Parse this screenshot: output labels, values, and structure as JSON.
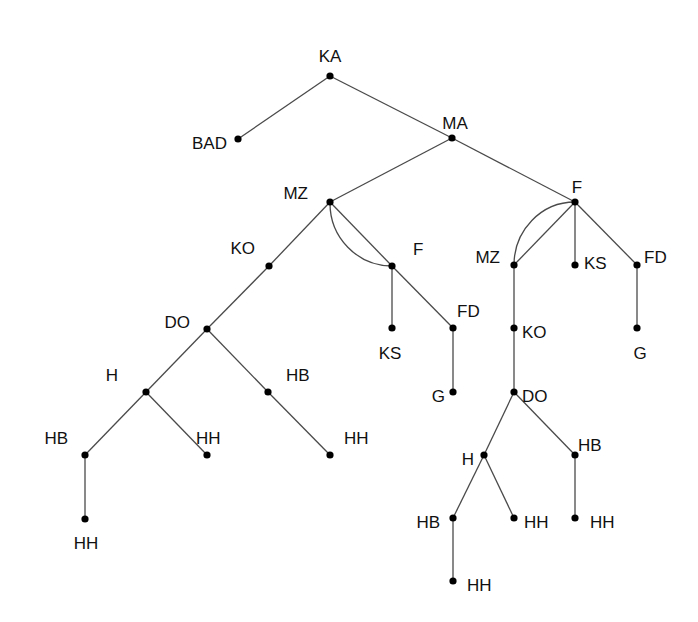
{
  "diagram": {
    "type": "tree",
    "colors": {
      "edge": "#4a4a4a",
      "node": "#000000",
      "label": "#111111",
      "background": "#ffffff"
    },
    "nodes": [
      {
        "id": "n1",
        "label": "KA",
        "x": 330,
        "y": 76,
        "lx": 330,
        "ly": 58,
        "anchor": "middle"
      },
      {
        "id": "n2",
        "label": "BAD",
        "x": 238,
        "y": 139,
        "lx": 227,
        "ly": 145,
        "anchor": "end"
      },
      {
        "id": "n3",
        "label": "MA",
        "x": 452,
        "y": 138,
        "lx": 455,
        "ly": 125,
        "anchor": "middle"
      },
      {
        "id": "n4",
        "label": "MZ",
        "x": 330,
        "y": 202,
        "lx": 308,
        "ly": 195,
        "anchor": "end"
      },
      {
        "id": "n5",
        "label": "F",
        "x": 575,
        "y": 202,
        "lx": 577,
        "ly": 189,
        "anchor": "middle"
      },
      {
        "id": "n6",
        "label": "KO",
        "x": 269,
        "y": 266,
        "lx": 255,
        "ly": 250,
        "anchor": "end"
      },
      {
        "id": "n7",
        "label": "F",
        "x": 392,
        "y": 266,
        "lx": 413,
        "ly": 251,
        "anchor": "start"
      },
      {
        "id": "n8",
        "label": "MZ",
        "x": 514,
        "y": 265,
        "lx": 500,
        "ly": 259,
        "anchor": "end"
      },
      {
        "id": "n9",
        "label": "KS",
        "x": 575,
        "y": 265,
        "lx": 584,
        "ly": 265,
        "anchor": "start"
      },
      {
        "id": "n10",
        "label": "FD",
        "x": 637,
        "y": 265,
        "lx": 644,
        "ly": 259,
        "anchor": "start"
      },
      {
        "id": "n11",
        "label": "DO",
        "x": 207,
        "y": 329,
        "lx": 190,
        "ly": 324,
        "anchor": "end"
      },
      {
        "id": "n12",
        "label": "KS",
        "x": 392,
        "y": 328,
        "lx": 390,
        "ly": 355,
        "anchor": "middle"
      },
      {
        "id": "n13",
        "label": "FD",
        "x": 453,
        "y": 328,
        "lx": 457,
        "ly": 313,
        "anchor": "start"
      },
      {
        "id": "n14",
        "label": "KO",
        "x": 514,
        "y": 328,
        "lx": 522,
        "ly": 334,
        "anchor": "start"
      },
      {
        "id": "n15",
        "label": "G",
        "x": 637,
        "y": 328,
        "lx": 640,
        "ly": 355,
        "anchor": "middle"
      },
      {
        "id": "n16",
        "label": "H",
        "x": 146,
        "y": 392,
        "lx": 118,
        "ly": 377,
        "anchor": "end"
      },
      {
        "id": "n17",
        "label": "HB",
        "x": 268,
        "y": 392,
        "lx": 286,
        "ly": 377,
        "anchor": "start"
      },
      {
        "id": "n18",
        "label": "G",
        "x": 453,
        "y": 392,
        "lx": 445,
        "ly": 398,
        "anchor": "end"
      },
      {
        "id": "n19",
        "label": "DO",
        "x": 514,
        "y": 392,
        "lx": 522,
        "ly": 398,
        "anchor": "start"
      },
      {
        "id": "n20",
        "label": "HB",
        "x": 85,
        "y": 455,
        "lx": 68,
        "ly": 440,
        "anchor": "end"
      },
      {
        "id": "n21",
        "label": "HH",
        "x": 207,
        "y": 455,
        "lx": 196,
        "ly": 440,
        "anchor": "start"
      },
      {
        "id": "n22",
        "label": "HH",
        "x": 330,
        "y": 455,
        "lx": 344,
        "ly": 440,
        "anchor": "start"
      },
      {
        "id": "n23",
        "label": "H",
        "x": 484,
        "y": 455,
        "lx": 474,
        "ly": 461,
        "anchor": "end"
      },
      {
        "id": "n24",
        "label": "HB",
        "x": 575,
        "y": 455,
        "lx": 578,
        "ly": 447,
        "anchor": "start"
      },
      {
        "id": "n25",
        "label": "HH",
        "x": 85,
        "y": 519,
        "lx": 86,
        "ly": 545,
        "anchor": "middle"
      },
      {
        "id": "n26",
        "label": "HB",
        "x": 453,
        "y": 518,
        "lx": 440,
        "ly": 524,
        "anchor": "end"
      },
      {
        "id": "n27",
        "label": "HH",
        "x": 514,
        "y": 518,
        "lx": 524,
        "ly": 524,
        "anchor": "start"
      },
      {
        "id": "n28",
        "label": "HH",
        "x": 575,
        "y": 518,
        "lx": 590,
        "ly": 524,
        "anchor": "start"
      },
      {
        "id": "n29",
        "label": "HH",
        "x": 453,
        "y": 581,
        "lx": 467,
        "ly": 587,
        "anchor": "start"
      }
    ],
    "edges": [
      [
        "n1",
        "n2"
      ],
      [
        "n1",
        "n3"
      ],
      [
        "n3",
        "n4"
      ],
      [
        "n3",
        "n5"
      ],
      [
        "n4",
        "n6"
      ],
      [
        "n4",
        "n7"
      ],
      [
        "n5",
        "n8"
      ],
      [
        "n5",
        "n9"
      ],
      [
        "n5",
        "n10"
      ],
      [
        "n6",
        "n11"
      ],
      [
        "n7",
        "n12"
      ],
      [
        "n7",
        "n13"
      ],
      [
        "n8",
        "n14"
      ],
      [
        "n10",
        "n15"
      ],
      [
        "n11",
        "n16"
      ],
      [
        "n11",
        "n17"
      ],
      [
        "n13",
        "n18"
      ],
      [
        "n14",
        "n19"
      ],
      [
        "n16",
        "n20"
      ],
      [
        "n16",
        "n21"
      ],
      [
        "n17",
        "n22"
      ],
      [
        "n19",
        "n23"
      ],
      [
        "n19",
        "n24"
      ],
      [
        "n20",
        "n25"
      ],
      [
        "n23",
        "n26"
      ],
      [
        "n23",
        "n27"
      ],
      [
        "n24",
        "n28"
      ],
      [
        "n26",
        "n29"
      ]
    ],
    "arcs": [
      {
        "from": "n4",
        "to": "n7",
        "path": "M330,202 A62,63 0 0 0 392,266"
      },
      {
        "from": "n8",
        "to": "n5",
        "path": "M514,265 A61,63 0 0 1 575,202"
      }
    ]
  }
}
